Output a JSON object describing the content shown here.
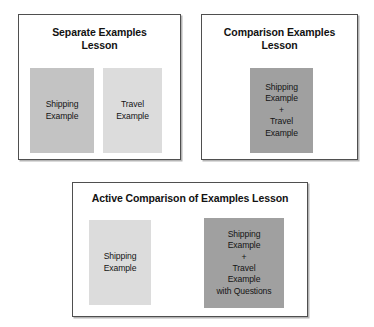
{
  "diagram": {
    "background_color": "#ffffff",
    "border_color": "#4f4f4f",
    "text_color": "#141414",
    "shades": {
      "medium_gray": "#c3c3c3",
      "light_gray": "#dcdcdc",
      "dark_gray": "#a0a0a0"
    }
  },
  "panels": [
    {
      "id": "separate",
      "title": "Separate Examples\nLesson",
      "cards": [
        {
          "id": "sep-shipping",
          "label": "Shipping\nExample",
          "fill": "#c3c3c3"
        },
        {
          "id": "sep-travel",
          "label": "Travel\nExample",
          "fill": "#dcdcdc"
        }
      ]
    },
    {
      "id": "comparison",
      "title": "Comparison Examples\nLesson",
      "cards": [
        {
          "id": "comp-combined",
          "label": "Shipping\nExample\n+\nTravel\nExample",
          "fill": "#a0a0a0"
        }
      ]
    },
    {
      "id": "active",
      "title": "Active Comparison of Examples Lesson",
      "cards": [
        {
          "id": "act-shipping",
          "label": "Shipping\nExample",
          "fill": "#dcdcdc"
        },
        {
          "id": "act-combined",
          "label": "Shipping\nExample\n+\nTravel\nExample\nwith Questions",
          "fill": "#a0a0a0"
        }
      ]
    }
  ]
}
